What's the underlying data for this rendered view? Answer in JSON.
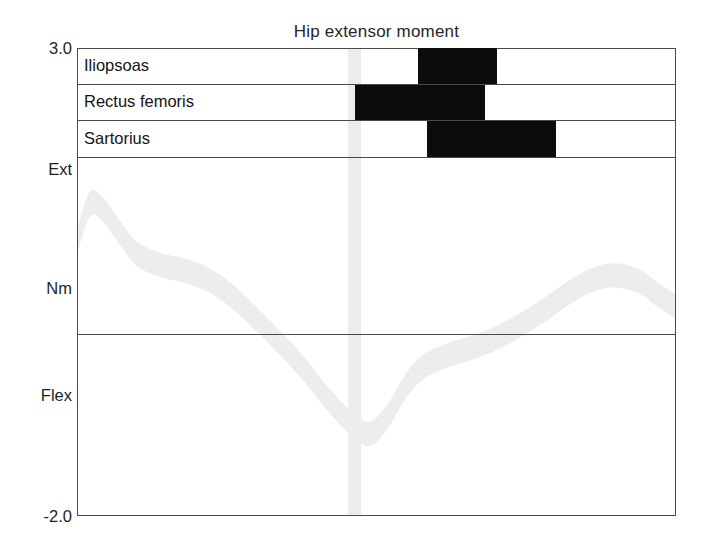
{
  "chart": {
    "title": "Hip extensor moment",
    "y_axis": {
      "top_label": "3.0",
      "bottom_label": "-2.0",
      "positive_direction_label": "Ext",
      "unit_label": "Nm",
      "negative_direction_label": "Flex"
    }
  },
  "emg": {
    "rows": [
      {
        "label": "Iliopsoas",
        "start_pct": 57.0,
        "end_pct": 70.1
      },
      {
        "label": "Rectus femoris",
        "start_pct": 46.4,
        "end_pct": 68.1
      },
      {
        "label": "Sartorius",
        "start_pct": 58.4,
        "end_pct": 79.9
      }
    ]
  },
  "chart_data": {
    "type": "line",
    "title": "Hip extensor moment",
    "xlabel": "",
    "ylabel": "Nm",
    "ylim": [
      -2.0,
      3.0
    ],
    "xlim": [
      0,
      100
    ],
    "grid": false,
    "legend": null,
    "yticks": [
      "3.0",
      "-2.0"
    ],
    "y_direction_labels": [
      "Ext",
      "Nm",
      "Flex"
    ],
    "zero_line": 0.0,
    "annotations": [
      {
        "name": "toe-off-band",
        "type": "vspan",
        "x_start": 45.2,
        "x_end": 47.4
      }
    ],
    "series": [
      {
        "name": "Hip extensor moment",
        "style": "band",
        "band_half_width": 0.13,
        "x": [
          0,
          2,
          4,
          7,
          10,
          14,
          18,
          22,
          26,
          30,
          34,
          38,
          42,
          46,
          49,
          52,
          55,
          58,
          62,
          66,
          70,
          74,
          78,
          82,
          86,
          90,
          94,
          97,
          100
        ],
        "values": [
          0.92,
          1.32,
          1.3,
          1.04,
          0.8,
          0.68,
          0.62,
          0.52,
          0.34,
          0.1,
          -0.16,
          -0.44,
          -0.76,
          -1.02,
          -1.12,
          -0.92,
          -0.6,
          -0.4,
          -0.28,
          -0.2,
          -0.1,
          0.04,
          0.2,
          0.38,
          0.52,
          0.57,
          0.5,
          0.36,
          0.24
        ]
      }
    ],
    "emg_bars": [
      {
        "muscle": "Iliopsoas",
        "on_pct": 57.0,
        "off_pct": 70.1
      },
      {
        "muscle": "Rectus femoris",
        "on_pct": 46.4,
        "off_pct": 68.1
      },
      {
        "muscle": "Sartorius",
        "on_pct": 58.4,
        "off_pct": 79.9
      }
    ]
  },
  "colors": {
    "axis": "#4a4a4a",
    "emg_bar": "#0c0c0c",
    "curve_band": "#ededed",
    "toeoff_band": "#ececec",
    "text": "#1a1a1a"
  }
}
